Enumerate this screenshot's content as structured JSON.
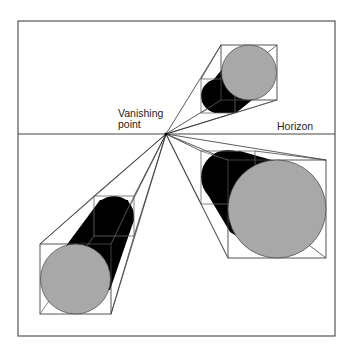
{
  "diagram": {
    "type": "one-point perspective",
    "labels": {
      "vanishing_point_line1": "Vanishing",
      "vanishing_point_line2": "point",
      "horizon": "Horizon"
    },
    "colors": {
      "frame": "#555555",
      "lines": "#333333",
      "cylinder_body": "#000000",
      "cylinder_face": "#a8a8a8",
      "background": "#ffffff"
    },
    "frame": {
      "x1": 18,
      "y1": 21,
      "x2": 335,
      "y2": 336
    },
    "horizon_y": 134,
    "vanishing_point": {
      "x": 166,
      "y": 134
    },
    "objects": [
      {
        "name": "upper-right cylinder",
        "front": [
          221,
          45,
          277,
          100
        ],
        "back": [
          201,
          79,
          235,
          113
        ]
      },
      {
        "name": "right cylinder",
        "front": [
          228,
          160,
          326,
          258
        ],
        "back": [
          201,
          151,
          255,
          204
        ]
      },
      {
        "name": "lower-left cylinder",
        "front": [
          40,
          244,
          111,
          314
        ],
        "back": [
          94,
          196,
          134,
          236
        ]
      }
    ]
  }
}
